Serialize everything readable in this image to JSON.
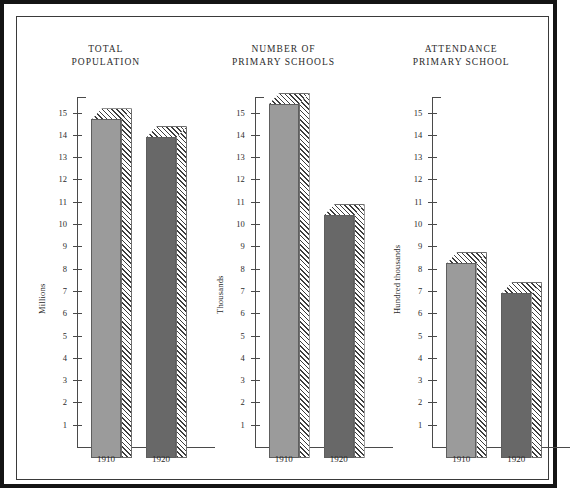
{
  "figure": {
    "background_color": "#ffffff",
    "border_color": "#141414",
    "bar_light_color": "#9b9b9b",
    "bar_dark_color": "#686868",
    "hatch_color": "#3d3d3d",
    "axis_color": "#4a4a4a"
  },
  "chart_data": [
    {
      "type": "bar",
      "title": "TOTAL\nPOPULATION",
      "xlabel": "",
      "ylabel": "Millions",
      "categories": [
        "1910",
        "1920"
      ],
      "values": [
        15.2,
        14.4
      ],
      "ylim": [
        0,
        15.7
      ],
      "yticks": [
        1,
        2,
        3,
        4,
        5,
        6,
        7,
        8,
        9,
        10,
        11,
        12,
        13,
        14,
        15
      ],
      "ytick_labels": [
        "1",
        "2",
        "3",
        "4",
        "5",
        "6",
        "7",
        "8",
        "9",
        "10",
        "11",
        "12",
        "13",
        "14",
        "15"
      ],
      "grid": false,
      "legend": "none"
    },
    {
      "type": "bar",
      "title": "NUMBER  OF\nPRIMARY  SCHOOLS",
      "xlabel": "",
      "ylabel": "Thousands",
      "categories": [
        "1910",
        "1920"
      ],
      "values": [
        15.9,
        10.9
      ],
      "ylim": [
        0,
        15.7
      ],
      "yticks": [
        1,
        2,
        3,
        4,
        5,
        6,
        7,
        8,
        9,
        10,
        11,
        12,
        13,
        14,
        15
      ],
      "ytick_labels": [
        "1",
        "2",
        "3",
        "4",
        "5",
        "6",
        "7",
        "8",
        "9",
        "10",
        "11",
        "12",
        "13",
        "14",
        "15"
      ],
      "grid": false,
      "legend": "none"
    },
    {
      "type": "bar",
      "title": "ATTENDANCE\nPRIMARY  SCHOOL",
      "xlabel": "",
      "ylabel": "Hundred thousands",
      "categories": [
        "1910",
        "1920"
      ],
      "values": [
        8.75,
        7.4
      ],
      "ylim": [
        0,
        15.7
      ],
      "yticks": [
        1,
        2,
        3,
        4,
        5,
        6,
        7,
        8,
        9,
        10,
        11,
        12,
        13,
        14,
        15
      ],
      "ytick_labels": [
        "1",
        "2",
        "3",
        "4",
        "5",
        "6",
        "7",
        "8",
        "9",
        "10",
        "11",
        "12",
        "13",
        "14",
        "15"
      ],
      "grid": false,
      "legend": "none"
    }
  ]
}
